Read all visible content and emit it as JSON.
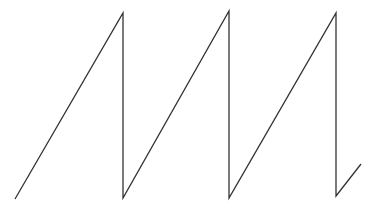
{
  "diagram": {
    "type": "sawtooth-waveform",
    "background": "#ffffff",
    "stroke_color": "#333333",
    "stroke_width": 1.3,
    "points": [
      [
        15,
        199
      ],
      [
        123,
        13
      ],
      [
        123,
        198
      ],
      [
        229,
        11
      ],
      [
        229,
        198
      ],
      [
        336,
        13
      ],
      [
        336,
        196
      ],
      [
        361,
        164
      ]
    ]
  }
}
